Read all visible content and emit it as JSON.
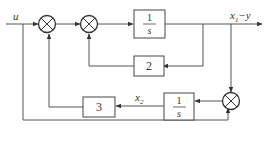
{
  "diagram": {
    "type": "block-diagram",
    "input_label": "u",
    "output_label": "x₁−y",
    "output_label_main": "x",
    "output_label_sub": "1",
    "output_label_suffix": "−y",
    "state2_label_main": "x",
    "state2_label_sub": "2",
    "blocks": {
      "integrator1": {
        "num": "1",
        "den": "s"
      },
      "gain2": {
        "label": "2"
      },
      "gain3": {
        "label": "3"
      },
      "integrator2": {
        "num": "1",
        "den": "s"
      }
    },
    "summing_junctions": [
      "sum1",
      "sum2",
      "sum3"
    ]
  }
}
